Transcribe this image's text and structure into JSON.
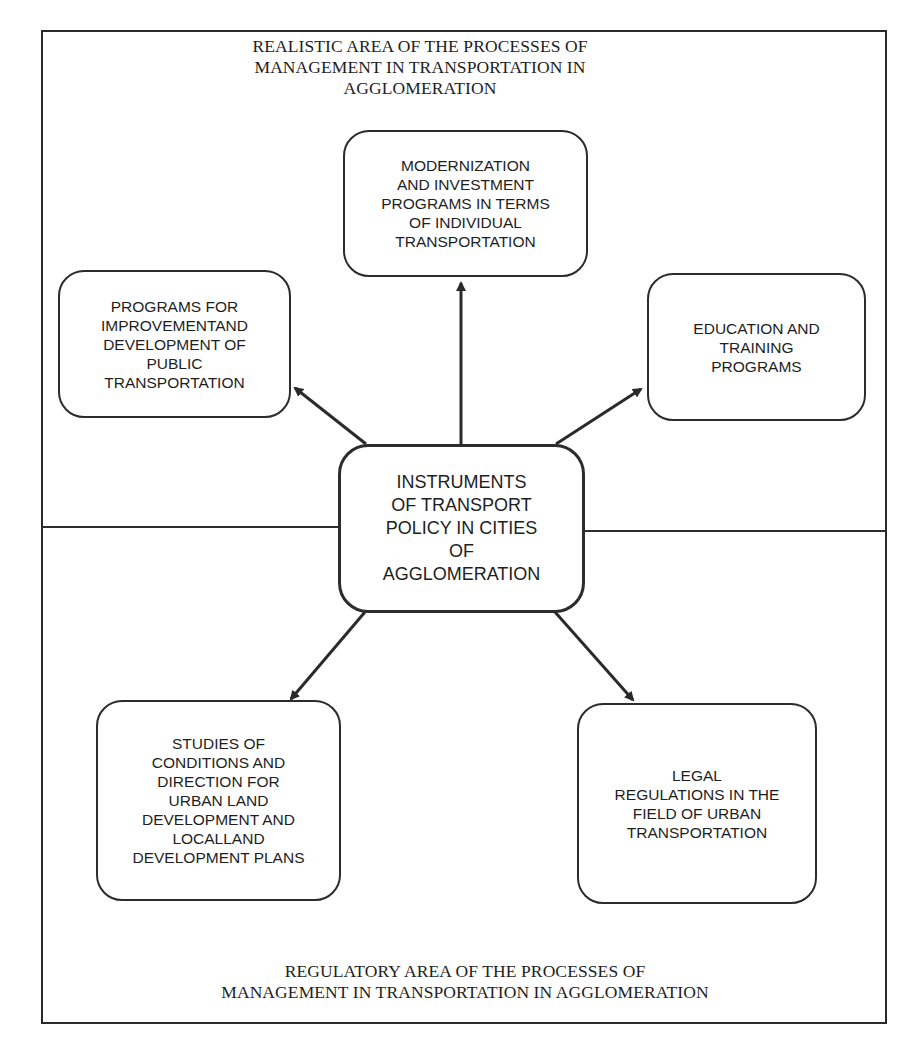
{
  "diagram": {
    "top_area_title": "REALISTIC AREA OF THE PROCESSES OF\nMANAGEMENT IN TRANSPORTATION IN\nAGGLOMERATION",
    "bottom_area_title": "REGULATORY AREA OF THE PROCESSES OF\nMANAGEMENT IN TRANSPORTATION IN AGGLOMERATION",
    "center": {
      "label": "INSTRUMENTS\nOF TRANSPORT\nPOLICY IN CITIES\nOF\nAGGLOMERATION"
    },
    "nodes": [
      {
        "id": "modernization",
        "label": "MODERNIZATION\nAND INVESTMENT\nPROGRAMS IN TERMS\nOF INDIVIDUAL\nTRANSPORTATION"
      },
      {
        "id": "public-transport",
        "label": "PROGRAMS FOR\nIMPROVEMENTAND\nDEVELOPMENT OF\nPUBLIC\nTRANSPORTATION"
      },
      {
        "id": "education",
        "label": "EDUCATION AND\nTRAINING\nPROGRAMS"
      },
      {
        "id": "studies",
        "label": "STUDIES OF\nCONDITIONS AND\nDIRECTION FOR\nURBAN LAND\nDEVELOPMENT AND\nLOCALLAND\nDEVELOPMENT PLANS"
      },
      {
        "id": "legal",
        "label": "LEGAL\nREGULATIONS IN THE\nFIELD OF URBAN\nTRANSPORTATION"
      }
    ],
    "edges": [
      {
        "from": "center",
        "to": "modernization"
      },
      {
        "from": "center",
        "to": "public-transport"
      },
      {
        "from": "center",
        "to": "education"
      },
      {
        "from": "center",
        "to": "studies"
      },
      {
        "from": "center",
        "to": "legal"
      }
    ],
    "colors": {
      "line": "#2a2a2a",
      "text": "#1e1e1e",
      "background": "#ffffff"
    }
  }
}
